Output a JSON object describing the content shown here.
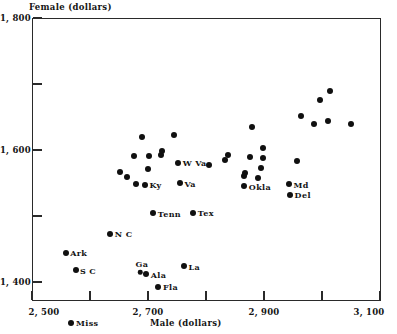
{
  "chart_data": {
    "type": "scatter",
    "title": "",
    "xlabel": "Male (dollars)",
    "ylabel": "Female (dollars)",
    "xlim": [
      2500,
      3100
    ],
    "ylim": [
      1300,
      1800
    ],
    "grid": false,
    "legend": "none",
    "xticks": [
      {
        "value": 2500,
        "label": "2, 500"
      },
      {
        "value": 2600,
        "label": ""
      },
      {
        "value": 2700,
        "label": "2, 700"
      },
      {
        "value": 2800,
        "label": ""
      },
      {
        "value": 2900,
        "label": "2, 900"
      },
      {
        "value": 3000,
        "label": ""
      },
      {
        "value": 3100,
        "label": "3, 100"
      }
    ],
    "yticks": [
      {
        "value": 1800,
        "label": "1, 800"
      },
      {
        "value": 1700,
        "label": ""
      },
      {
        "value": 1600,
        "label": "1, 600"
      },
      {
        "value": 1500,
        "label": ""
      },
      {
        "value": 1400,
        "label": "1, 400"
      }
    ],
    "points": [
      {
        "label": "Miss",
        "x": 2568,
        "y": 1338,
        "side": "right"
      },
      {
        "label": "S C",
        "x": 2575,
        "y": 1418,
        "side": "right"
      },
      {
        "label": "Ark",
        "x": 2558,
        "y": 1444,
        "side": "right"
      },
      {
        "label": "Ga",
        "x": 2687,
        "y": 1415,
        "side": "above"
      },
      {
        "label": "Ala",
        "x": 2697,
        "y": 1412,
        "side": "right"
      },
      {
        "label": "Fla",
        "x": 2718,
        "y": 1393,
        "side": "right"
      },
      {
        "label": "N C",
        "x": 2635,
        "y": 1473,
        "side": "right"
      },
      {
        "label": "La",
        "x": 2762,
        "y": 1424,
        "side": "right"
      },
      {
        "label": "Tenn",
        "x": 2709,
        "y": 1504,
        "side": "right"
      },
      {
        "label": "Tex",
        "x": 2778,
        "y": 1505,
        "side": "right"
      },
      {
        "label": "Ky",
        "x": 2695,
        "y": 1547,
        "side": "right"
      },
      {
        "label": "Va",
        "x": 2755,
        "y": 1550,
        "side": "right"
      },
      {
        "label": "W Va",
        "x": 2752,
        "y": 1581,
        "side": "right"
      },
      {
        "label": "",
        "x": 2679,
        "y": 1549
      },
      {
        "label": "",
        "x": 2663,
        "y": 1559
      },
      {
        "label": "",
        "x": 2652,
        "y": 1567
      },
      {
        "label": "",
        "x": 2700,
        "y": 1571
      },
      {
        "label": "",
        "x": 2702,
        "y": 1591
      },
      {
        "label": "",
        "x": 2722,
        "y": 1592
      },
      {
        "label": "",
        "x": 2724,
        "y": 1598
      },
      {
        "label": "",
        "x": 2676,
        "y": 1591
      },
      {
        "label": "",
        "x": 2690,
        "y": 1620
      },
      {
        "label": "",
        "x": 2745,
        "y": 1623
      },
      {
        "label": "",
        "x": 2805,
        "y": 1578
      },
      {
        "label": "",
        "x": 2833,
        "y": 1585
      },
      {
        "label": "",
        "x": 2838,
        "y": 1593
      },
      {
        "label": "Okla",
        "x": 2866,
        "y": 1545,
        "side": "right"
      },
      {
        "label": "",
        "x": 2866,
        "y": 1561
      },
      {
        "label": "",
        "x": 2868,
        "y": 1565
      },
      {
        "label": "",
        "x": 2876,
        "y": 1590
      },
      {
        "label": "",
        "x": 2890,
        "y": 1558
      },
      {
        "label": "",
        "x": 2894,
        "y": 1572
      },
      {
        "label": "",
        "x": 2898,
        "y": 1588
      },
      {
        "label": "",
        "x": 2899,
        "y": 1603
      },
      {
        "label": "",
        "x": 2879,
        "y": 1635
      },
      {
        "label": "Md",
        "x": 2943,
        "y": 1548,
        "side": "right"
      },
      {
        "label": "Del",
        "x": 2945,
        "y": 1532,
        "side": "right"
      },
      {
        "label": "",
        "x": 2957,
        "y": 1584
      },
      {
        "label": "",
        "x": 2987,
        "y": 1640
      },
      {
        "label": "",
        "x": 2963,
        "y": 1652
      },
      {
        "label": "",
        "x": 2997,
        "y": 1676
      },
      {
        "label": "",
        "x": 3010,
        "y": 1644
      },
      {
        "label": "",
        "x": 3013,
        "y": 1689
      },
      {
        "label": "",
        "x": 3050,
        "y": 1640
      }
    ]
  }
}
